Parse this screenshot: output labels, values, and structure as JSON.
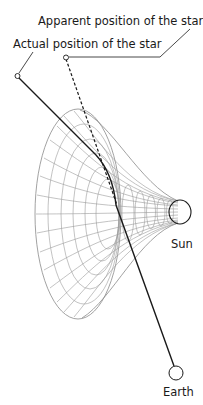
{
  "diagram": {
    "labels": {
      "apparent_star": "Apparent position of the star",
      "actual_star": "Actual position of the star",
      "sun": "Sun",
      "earth": "Earth"
    },
    "elements": {
      "spacetime_funnel": "curved spacetime grid around the Sun",
      "light_ray": "solid line bending from actual star position to Earth",
      "apparent_line": "dashed line straight back from Earth to apparent star position"
    },
    "colors": {
      "line": "#1a1a1a",
      "grid": "#9a9a9a",
      "background": "#ffffff"
    }
  }
}
